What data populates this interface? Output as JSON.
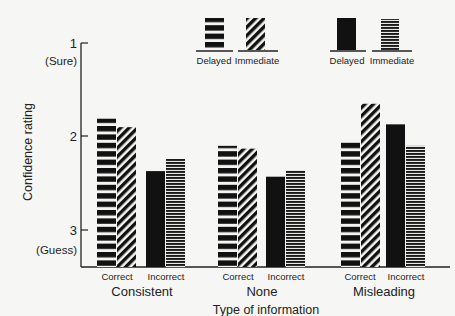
{
  "chart_data": {
    "type": "bar",
    "title": "",
    "xlabel": "Type of information",
    "ylabel": "Confidence rating",
    "y_inverted": true,
    "ylim": [
      1,
      3.39
    ],
    "yticks": [
      {
        "value": 1,
        "label": "1",
        "sublabel": "(Sure)"
      },
      {
        "value": 2,
        "label": "2",
        "sublabel": ""
      },
      {
        "value": 3,
        "label": "3",
        "sublabel": "(Guess)"
      }
    ],
    "grid": false,
    "groups": [
      {
        "name": "Consistent",
        "subgroups": [
          {
            "name": "Correct",
            "delayed": 1.81,
            "immediate": 1.9
          },
          {
            "name": "Incorrect",
            "delayed": 2.37,
            "immediate": 2.24
          }
        ]
      },
      {
        "name": "None",
        "subgroups": [
          {
            "name": "Correct",
            "delayed": 2.1,
            "immediate": 2.13
          },
          {
            "name": "Incorrect",
            "delayed": 2.43,
            "immediate": 2.36
          }
        ]
      },
      {
        "name": "Misleading",
        "subgroups": [
          {
            "name": "Correct",
            "delayed": 2.05,
            "immediate": 1.65
          },
          {
            "name": "Incorrect",
            "delayed": 1.87,
            "immediate": 2.1
          }
        ]
      }
    ],
    "categories": [
      "Consistent Correct",
      "Consistent Incorrect",
      "None Correct",
      "None Incorrect",
      "Misleading Correct",
      "Misleading Incorrect"
    ],
    "series": [
      {
        "name": "Delayed",
        "values": [
          1.81,
          2.37,
          2.1,
          2.43,
          2.05,
          1.87
        ]
      },
      {
        "name": "Immediate",
        "values": [
          1.9,
          2.24,
          2.13,
          2.36,
          1.65,
          2.1
        ]
      }
    ],
    "legend": {
      "position": "top-right",
      "correct_pair": [
        {
          "label": "Delayed",
          "pattern": "thick-horizontal-stripes"
        },
        {
          "label": "Immediate",
          "pattern": "diagonal-stripes"
        }
      ],
      "incorrect_pair": [
        {
          "label": "Delayed",
          "pattern": "solid-black"
        },
        {
          "label": "Immediate",
          "pattern": "fine-horizontal-stripes"
        }
      ]
    }
  },
  "labels": {
    "ylabel": "Confidence rating",
    "xlabel": "Type of information",
    "tick1": "1",
    "tick1_sub": "(Sure)",
    "tick2": "2",
    "tick3": "3",
    "tick3_sub": "(Guess)",
    "correct": "Correct",
    "incorrect": "Incorrect",
    "group1": "Consistent",
    "group2": "None",
    "group3": "Misleading",
    "legend_delayed": "Delayed",
    "legend_immediate": "Immediate"
  }
}
